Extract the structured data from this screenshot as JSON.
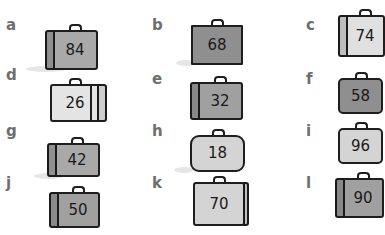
{
  "items": [
    {
      "letter": "a",
      "number": "84"
    },
    {
      "letter": "b",
      "number": "68"
    },
    {
      "letter": "c",
      "number": "74"
    },
    {
      "letter": "d",
      "number": "26"
    },
    {
      "letter": "e",
      "number": "32"
    },
    {
      "letter": "f",
      "number": "58"
    },
    {
      "letter": "g",
      "number": "42"
    },
    {
      "letter": "h",
      "number": "18"
    },
    {
      "letter": "i",
      "number": "96"
    },
    {
      "letter": "j",
      "number": "50"
    },
    {
      "letter": "k",
      "number": "70"
    },
    {
      "letter": "l",
      "number": "90"
    }
  ],
  "colors": {
    "dark_case": "#8f8f8f",
    "mid_case": "#a9a9a9",
    "light_case": "#d4d4d4",
    "very_light_case": "#e4e4e4",
    "letter": "#6e6e6e",
    "outline": "#1e1e1e"
  }
}
